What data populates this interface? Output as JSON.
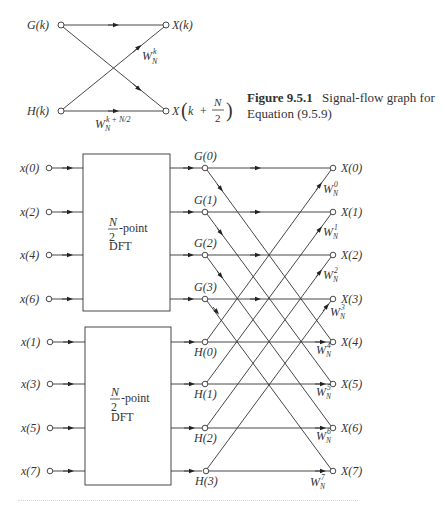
{
  "figure_top": {
    "caption_label": "Figure 9.5.1",
    "caption_text": "Signal-flow graph for",
    "caption_text2": "Equation (9.5.9)",
    "nodes": {
      "g": "G(k)",
      "h": "H(k)",
      "xk": "X(k)",
      "xkn2_prefix": "X",
      "xkn2_k": "k",
      "xkn2_plus": "+",
      "xkn2_num": "N",
      "xkn2_den": "2"
    },
    "weights": {
      "cross": {
        "base": "W",
        "sup": "k",
        "sub": "N"
      },
      "bottom": {
        "base": "W",
        "sup": "k + N/2",
        "sub": "N"
      }
    }
  },
  "figure_bottom": {
    "inputs_top": [
      "x(0)",
      "x(2)",
      "x(4)",
      "x(6)"
    ],
    "inputs_bottom": [
      "x(1)",
      "x(3)",
      "x(5)",
      "x(7)"
    ],
    "dft_block": {
      "frac_num": "N",
      "frac_den": "2",
      "suffix": "-point",
      "line2": "DFT"
    },
    "g_nodes": [
      "G(0)",
      "G(1)",
      "G(2)",
      "G(3)"
    ],
    "h_nodes": [
      "H(0)",
      "H(1)",
      "H(2)",
      "H(3)"
    ],
    "outputs": [
      "X(0)",
      "X(1)",
      "X(2)",
      "X(3)",
      "X(4)",
      "X(5)",
      "X(6)",
      "X(7)"
    ],
    "twiddles": [
      {
        "base": "W",
        "sup": "0",
        "sub": "N"
      },
      {
        "base": "W",
        "sup": "1",
        "sub": "N"
      },
      {
        "base": "W",
        "sup": "2",
        "sub": "N"
      },
      {
        "base": "W",
        "sup": "3",
        "sub": "N"
      },
      {
        "base": "W",
        "sup": "4",
        "sub": "N"
      },
      {
        "base": "W",
        "sup": "5",
        "sub": "N"
      },
      {
        "base": "W",
        "sup": "6",
        "sub": "N"
      },
      {
        "base": "W",
        "sup": "7",
        "sub": "N"
      }
    ]
  }
}
